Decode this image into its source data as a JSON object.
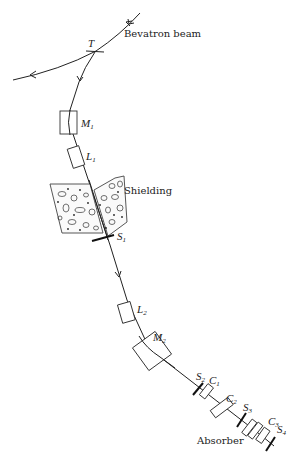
{
  "diagram": {
    "type": "beamline-schematic",
    "labels": {
      "beam_source": "Bevatron beam",
      "target": "T",
      "magnet1": {
        "main": "M",
        "sub": "1"
      },
      "lens1": {
        "main": "L",
        "sub": "1"
      },
      "shielding": "Shielding",
      "counter_s1": {
        "main": "S",
        "sub": "1"
      },
      "lens2": {
        "main": "L",
        "sub": "2"
      },
      "magnet2": {
        "main": "M",
        "sub": "2"
      },
      "counter_s2": {
        "main": "S",
        "sub": "2"
      },
      "cerenkov_c1": {
        "main": "C",
        "sub": "1"
      },
      "cerenkov_c2": {
        "main": "C",
        "sub": "2"
      },
      "counter_s3": {
        "main": "S",
        "sub": "3"
      },
      "cerenkov_c3": {
        "main": "C",
        "sub": "3"
      },
      "counter_s4": {
        "main": "S",
        "sub": "4"
      },
      "absorber": "Absorber"
    },
    "colors": {
      "ink": "#222222",
      "background": "#ffffff"
    }
  }
}
